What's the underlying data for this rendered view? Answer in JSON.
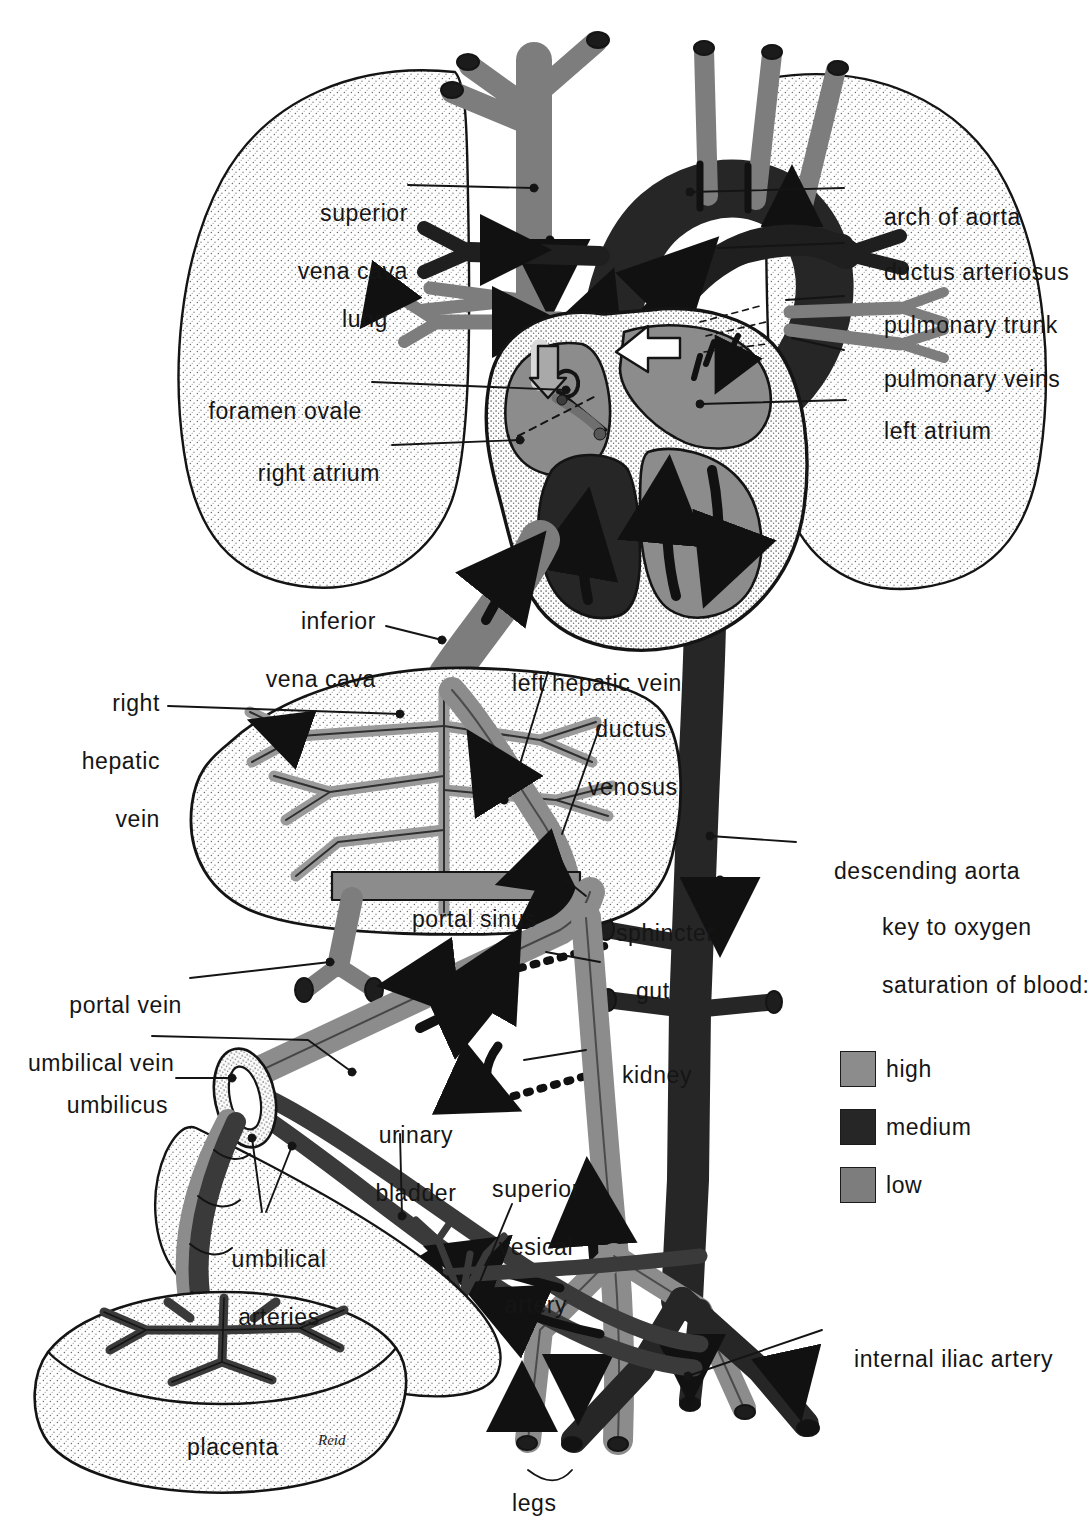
{
  "figure": {
    "signature": "Reid"
  },
  "palette": {
    "high": "#8c8c8c",
    "medium": "#262626",
    "low": "#7d7d7d",
    "outline": "#141414",
    "stipple_fill": "#fbfbfb",
    "paper": "#ffffff"
  },
  "key": {
    "title_line1": "key to oxygen",
    "title_line2": "saturation of blood:",
    "entries": [
      {
        "label": "high",
        "color": "#8c8c8c"
      },
      {
        "label": "medium",
        "color": "#262626"
      },
      {
        "label": "low",
        "color": "#7d7d7d"
      }
    ]
  },
  "labels_left": [
    {
      "id": "superior-vena-cava",
      "line1": "superior",
      "line2": "vena cava"
    },
    {
      "id": "lung",
      "line1": "lung",
      "line2": ""
    },
    {
      "id": "foramen-ovale",
      "line1": "foramen ovale",
      "line2": ""
    },
    {
      "id": "right-atrium",
      "line1": "right atrium",
      "line2": ""
    },
    {
      "id": "inferior-vena-cava",
      "line1": "inferior",
      "line2": "vena cava"
    },
    {
      "id": "right-hepatic-vein",
      "line1": "right",
      "line2": "hepatic",
      "line3": "vein"
    },
    {
      "id": "portal-vein",
      "line1": "portal vein",
      "line2": ""
    },
    {
      "id": "umbilical-vein",
      "line1": "umbilical vein",
      "line2": ""
    },
    {
      "id": "umbilicus",
      "line1": "umbilicus",
      "line2": ""
    },
    {
      "id": "umbilical-arteries",
      "line1": "umbilical",
      "line2": "arteries"
    },
    {
      "id": "placenta",
      "line1": "placenta",
      "line2": ""
    }
  ],
  "labels_right": [
    {
      "id": "arch-of-aorta",
      "line1": "arch of aorta"
    },
    {
      "id": "ductus-arteriosus",
      "line1": "ductus arteriosus"
    },
    {
      "id": "pulmonary-trunk",
      "line1": "pulmonary trunk"
    },
    {
      "id": "pulmonary-veins",
      "line1": "pulmonary veins"
    },
    {
      "id": "left-atrium",
      "line1": "left atrium"
    },
    {
      "id": "descending-aorta",
      "line1": "descending aorta"
    },
    {
      "id": "internal-iliac-artery",
      "line1": "internal iliac artery"
    }
  ],
  "labels_center": [
    {
      "id": "left-hepatic-vein",
      "line1": "left hepatic vein"
    },
    {
      "id": "ductus-venosus",
      "line1": "ductus",
      "line2": "venosus"
    },
    {
      "id": "portal-sinus",
      "line1": "portal sinus"
    },
    {
      "id": "sphincter",
      "line1": "sphincter"
    },
    {
      "id": "gut",
      "line1": "gut"
    },
    {
      "id": "kidney",
      "line1": "kidney"
    },
    {
      "id": "urinary-bladder",
      "line1": "urinary",
      "line2": "bladder"
    },
    {
      "id": "superior-vesical-artery",
      "line1": "superior",
      "line2": "vesical",
      "line3": "artery"
    },
    {
      "id": "legs",
      "line1": "legs"
    }
  ]
}
